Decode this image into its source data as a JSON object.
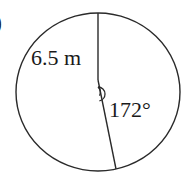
{
  "figure": {
    "part_label": ")",
    "radius_label": "6.5 m",
    "angle_label": "172°",
    "colors": {
      "stroke": "#2a2a2a",
      "text": "#1a1a1a",
      "background": "#ffffff"
    }
  }
}
